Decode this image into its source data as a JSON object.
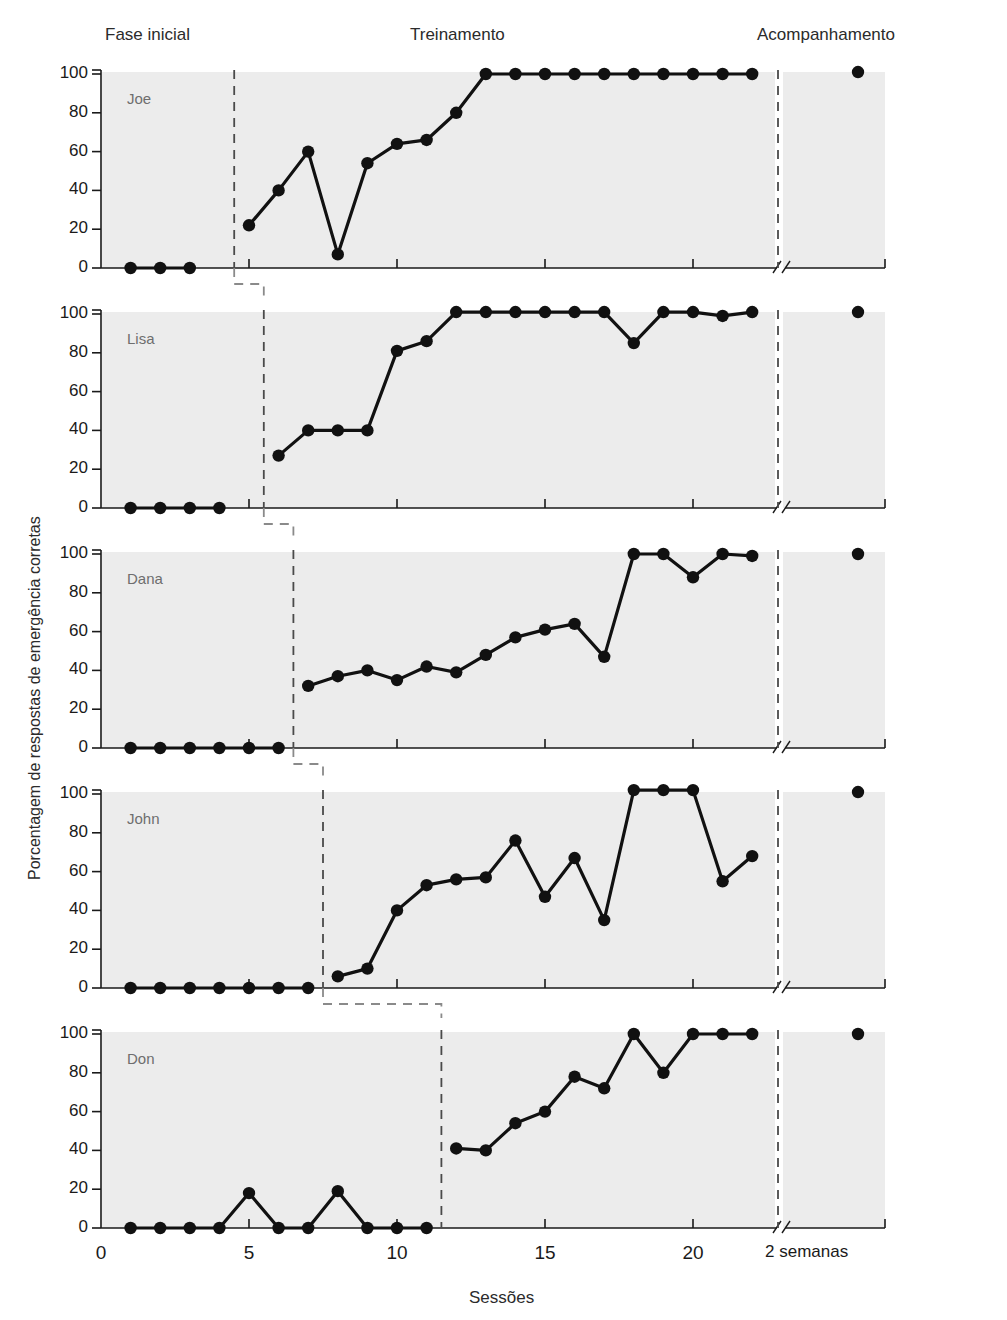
{
  "figure": {
    "phase_labels": [
      {
        "text": "Fase inicial",
        "x": 105,
        "y": 34
      },
      {
        "text": "Treinamento",
        "x": 410,
        "y": 34
      },
      {
        "text": "Acompanhamento",
        "x": 757,
        "y": 34
      }
    ],
    "y_axis_title": "Porcentagem de respostas de emergência corretas",
    "x_axis_title": "Sessões"
  },
  "chart_data": {
    "type": "line",
    "title": "",
    "xlabel": "Sessões",
    "ylabel": "Porcentagem de respostas de emergência corretas",
    "xlim": [
      0,
      22
    ],
    "ylim": [
      0,
      105
    ],
    "yticks": [
      0,
      20,
      40,
      60,
      80,
      100
    ],
    "xticks": [
      0,
      5,
      10,
      15,
      20
    ],
    "xtick_labels": [
      "0",
      "5",
      "10",
      "15",
      "20",
      "2 semanas"
    ],
    "followup_label": "2 semanas",
    "followup_x": 22,
    "axis_break": true,
    "grid": false,
    "legend": "none",
    "design": "multiple-baseline across participants",
    "phases": [
      "Fase inicial",
      "Treinamento",
      "Acompanhamento"
    ],
    "panels": [
      {
        "name": "Joe",
        "phase_change_session": 4.5,
        "followup_session": 22,
        "baseline": {
          "x": [
            1,
            2,
            3
          ],
          "y": [
            0,
            0,
            0
          ]
        },
        "training": {
          "x": [
            5,
            6,
            7,
            8,
            9,
            10,
            11,
            12,
            13,
            14,
            15,
            16,
            17,
            18,
            19,
            20,
            21,
            22
          ],
          "y": [
            22,
            40,
            60,
            7,
            54,
            64,
            66,
            80,
            100,
            100,
            100,
            100,
            100,
            100,
            100,
            100,
            100,
            100
          ]
        },
        "followup": {
          "x": [
            23.2
          ],
          "y": [
            101
          ]
        }
      },
      {
        "name": "Lisa",
        "phase_change_session": 5.5,
        "followup_session": 22,
        "baseline": {
          "x": [
            1,
            2,
            3,
            4
          ],
          "y": [
            0,
            0,
            0,
            0
          ]
        },
        "training": {
          "x": [
            6,
            7,
            8,
            9,
            10,
            11,
            12,
            13,
            14,
            15,
            16,
            17,
            18,
            19,
            20,
            21,
            22
          ],
          "y": [
            27,
            40,
            40,
            40,
            81,
            86,
            101,
            101,
            101,
            101,
            101,
            101,
            85,
            101,
            101,
            99,
            101
          ]
        },
        "followup": {
          "x": [
            23.2
          ],
          "y": [
            101
          ]
        }
      },
      {
        "name": "Dana",
        "phase_change_session": 6.5,
        "followup_session": 22,
        "baseline": {
          "x": [
            1,
            2,
            3,
            4,
            5,
            6
          ],
          "y": [
            0,
            0,
            0,
            0,
            0,
            0
          ]
        },
        "training": {
          "x": [
            7,
            8,
            9,
            10,
            11,
            12,
            13,
            14,
            15,
            16,
            17,
            18,
            19,
            20,
            21,
            22
          ],
          "y": [
            32,
            37,
            40,
            35,
            42,
            39,
            48,
            57,
            61,
            64,
            47,
            100,
            100,
            88,
            100,
            99
          ]
        },
        "followup": {
          "x": [
            23.2
          ],
          "y": [
            100
          ]
        }
      },
      {
        "name": "John",
        "phase_change_session": 7.5,
        "followup_session": 22,
        "baseline": {
          "x": [
            1,
            2,
            3,
            4,
            5,
            6,
            7
          ],
          "y": [
            0,
            0,
            0,
            0,
            0,
            0,
            0
          ]
        },
        "training": {
          "x": [
            8,
            9,
            10,
            11,
            12,
            13,
            14,
            15,
            16,
            17,
            18,
            19,
            20,
            21,
            22
          ],
          "y": [
            6,
            10,
            40,
            53,
            56,
            57,
            76,
            47,
            67,
            35,
            102,
            102,
            102,
            55,
            68
          ]
        },
        "followup": {
          "x": [
            23.2
          ],
          "y": [
            101
          ]
        }
      },
      {
        "name": "Don",
        "phase_change_session": 11.5,
        "followup_session": 22,
        "baseline": {
          "x": [
            1,
            2,
            3,
            4,
            5,
            6,
            7,
            8,
            9,
            10,
            11
          ],
          "y": [
            0,
            0,
            0,
            0,
            18,
            0,
            0,
            19,
            0,
            0,
            0
          ]
        },
        "training": {
          "x": [
            12,
            13,
            14,
            15,
            16,
            17,
            18,
            19,
            20,
            21,
            22
          ],
          "y": [
            41,
            40,
            54,
            60,
            78,
            72,
            100,
            80,
            100,
            100,
            100
          ]
        },
        "followup": {
          "x": [
            23.2
          ],
          "y": [
            100
          ]
        }
      }
    ]
  }
}
